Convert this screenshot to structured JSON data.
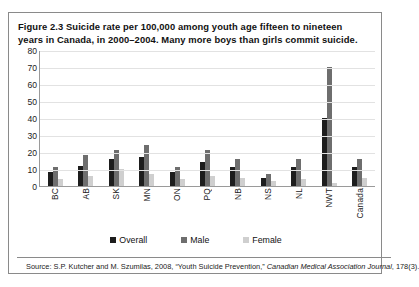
{
  "figure": {
    "caption": "Figure 2.3 Suicide rate per 100,000 among youth age fifteen to nineteen years in Canada, in 2000–2004. Many more boys than girls commit suicide.",
    "source_prefix": "Source: S.P. Kutcher and M. Szumilas, 2008, “Youth Suicide Prevention,” ",
    "source_italic": "Canadian Medical Association Journal",
    "source_suffix": ", 178(3)."
  },
  "colors": {
    "overall": "#1d1d1d",
    "male": "#6e6e6e",
    "female": "#cfcfcf",
    "gridline": "#e2e2e2",
    "axis": "#9a9a9a",
    "frame": "#8a8a8a"
  },
  "chart_data": {
    "type": "bar",
    "title": "Figure 2.3 Suicide rate per 100,000 among youth age fifteen to nineteen years in Canada, in 2000–2004. Many more boys than girls commit suicide.",
    "xlabel": "",
    "ylabel": "",
    "ylim": [
      0,
      80
    ],
    "yticks": [
      80,
      70,
      60,
      50,
      40,
      30,
      20,
      10,
      0
    ],
    "grid": true,
    "legend_position": "bottom",
    "categories": [
      "BC",
      "AB",
      "SK",
      "MN",
      "ON",
      "PQ",
      "NB",
      "NS",
      "NL",
      "NWT",
      "Canada"
    ],
    "series": [
      {
        "name": "Overall",
        "color": "#1d1d1d",
        "values": [
          8,
          12,
          16,
          17,
          8,
          14,
          11,
          5,
          11,
          40,
          11
        ]
      },
      {
        "name": "Male",
        "color": "#6e6e6e",
        "values": [
          11,
          18,
          21,
          24,
          11,
          21,
          16,
          7,
          16,
          70,
          16
        ]
      },
      {
        "name": "Female",
        "color": "#cfcfcf",
        "values": [
          4,
          6,
          10,
          7,
          4,
          6,
          5,
          3,
          4,
          2,
          5
        ]
      }
    ]
  }
}
